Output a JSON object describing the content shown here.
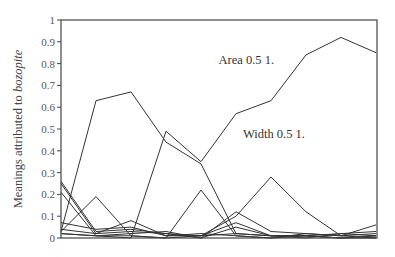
{
  "chart_data": {
    "type": "line",
    "title": "",
    "xlabel": "",
    "ylabel": "Meanings attributed to ",
    "ylabel_italic": "bozopite",
    "ylim": [
      0,
      1
    ],
    "yticks": [
      0,
      0.1,
      0.2,
      0.3,
      0.4,
      0.5,
      0.6,
      0.7,
      0.8,
      0.9,
      1
    ],
    "ytick_labels": [
      "0",
      "0.1",
      "0.2",
      "0.3",
      "0.4",
      "0.5",
      "0.6",
      "0.7",
      "0.8",
      "0.9",
      "1"
    ],
    "x": [
      1,
      2,
      3,
      4,
      5,
      6,
      7,
      8,
      9,
      10
    ],
    "xticks_shown": false,
    "grid": false,
    "legend": "none",
    "line_color": "#333333",
    "annotations": [
      {
        "text": "Area 0.5 1.",
        "x": 5.5,
        "y": 0.8
      },
      {
        "text": "Width 0.5 1.",
        "x": 6.2,
        "y": 0.46
      }
    ],
    "series": [
      {
        "name": "area",
        "values": [
          0.02,
          0.01,
          0.0,
          0.49,
          0.35,
          0.57,
          0.63,
          0.84,
          0.92,
          0.85
        ]
      },
      {
        "name": "hump",
        "values": [
          0.03,
          0.63,
          0.67,
          0.44,
          0.34,
          0.02,
          0.01,
          0.01,
          0.0,
          0.01
        ]
      },
      {
        "name": "width",
        "values": [
          0.02,
          0.01,
          0.01,
          0.0,
          0.01,
          0.1,
          0.28,
          0.12,
          0.01,
          0.06
        ]
      },
      {
        "name": "small-peaks",
        "values": [
          0.03,
          0.19,
          0.01,
          0.0,
          0.22,
          0.01,
          0.0,
          0.01,
          0.0,
          0.0
        ]
      },
      {
        "name": "high-start-1",
        "values": [
          0.26,
          0.03,
          0.04,
          0.02,
          0.0,
          0.12,
          0.03,
          0.02,
          0.01,
          0.02
        ]
      },
      {
        "name": "high-start-2",
        "values": [
          0.25,
          0.02,
          0.08,
          0.01,
          0.01,
          0.07,
          0.01,
          0.01,
          0.02,
          0.01
        ]
      },
      {
        "name": "high-start-3",
        "values": [
          0.21,
          0.01,
          0.02,
          0.03,
          0.0,
          0.05,
          0.01,
          0.0,
          0.02,
          0.03
        ]
      },
      {
        "name": "low-1",
        "values": [
          0.07,
          0.04,
          0.05,
          0.01,
          0.02,
          0.01,
          0.0,
          0.02,
          0.01,
          0.0
        ]
      },
      {
        "name": "low-2",
        "values": [
          0.04,
          0.02,
          0.03,
          0.02,
          0.01,
          0.02,
          0.01,
          0.01,
          0.0,
          0.01
        ]
      }
    ]
  }
}
